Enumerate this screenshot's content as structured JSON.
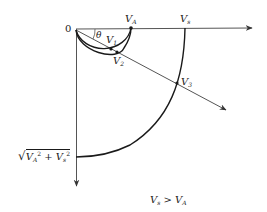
{
  "diagram": {
    "type": "velocity-locus",
    "colors": {
      "line": "#1a1a1a",
      "axis": "#555555"
    },
    "labels": {
      "origin": "0",
      "theta": "θ",
      "v_a": {
        "base": "V",
        "sub": "A"
      },
      "v_s": {
        "base": "V",
        "sub": "s"
      },
      "v1": {
        "base": "V",
        "sub": "1"
      },
      "v2": {
        "base": "V",
        "sub": "2"
      },
      "v3": {
        "base": "V",
        "sub": "3"
      },
      "magnitude": {
        "sqrt": "√",
        "v_a_base": "V",
        "v_a_sub": "A",
        "exp": "2",
        "plus": " + ",
        "v_s_base": "V",
        "v_s_sub": "s"
      },
      "condition": {
        "lhs_base": "V",
        "lhs_sub": "s",
        "op": " > ",
        "rhs_base": "V",
        "rhs_sub": "A"
      }
    }
  }
}
